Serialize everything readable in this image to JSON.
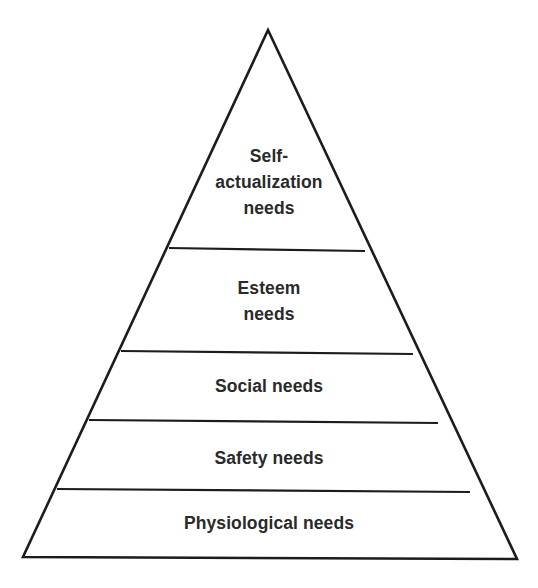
{
  "diagram": {
    "type": "pyramid",
    "title": "",
    "colors": {
      "background": "#ffffff",
      "stroke": "#1c1c1c",
      "text": "#2a2a2a"
    },
    "levels_top_to_bottom": [
      {
        "id": "self-actualization",
        "lines": [
          "Self-",
          "actualization",
          "needs"
        ]
      },
      {
        "id": "esteem",
        "lines": [
          "Esteem",
          "needs"
        ]
      },
      {
        "id": "social",
        "lines": [
          "Social needs"
        ]
      },
      {
        "id": "safety",
        "lines": [
          "Safety needs"
        ]
      },
      {
        "id": "physiological",
        "lines": [
          "Physiological needs"
        ]
      }
    ]
  }
}
